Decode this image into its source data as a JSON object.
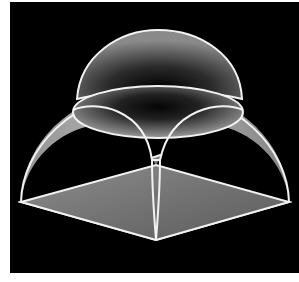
{
  "figure": {
    "background_color": "#000000",
    "page_color": "#ffffff",
    "edge_color": "#f2f2f2",
    "parts": [
      {
        "name": "upper-dome",
        "description": "hemispherical dome on top"
      },
      {
        "name": "drum-ring",
        "description": "elliptical ring where dome meets pendentives"
      },
      {
        "name": "pendentives",
        "description": "curved triangular surfaces between arches"
      },
      {
        "name": "square-base",
        "description": "square floor plan in perspective"
      }
    ]
  }
}
